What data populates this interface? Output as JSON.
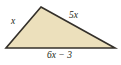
{
  "figure": {
    "shape": "triangle",
    "fill_color": "#ece0bc",
    "stroke_color": "#34302a",
    "background_color": "#ffffff",
    "vertices": {
      "apex": [
        41,
        7
      ],
      "bottom_left": [
        6,
        48
      ],
      "bottom_right": [
        115,
        48
      ]
    },
    "labels": {
      "left_side": "x",
      "right_side": "5x",
      "base": "6x − 3"
    }
  }
}
